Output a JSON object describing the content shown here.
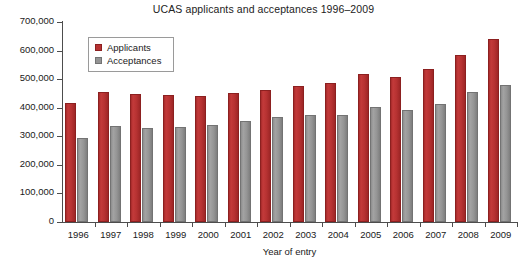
{
  "chart_data": {
    "type": "bar",
    "title": "UCAS applicants and acceptances 1996–2009",
    "xlabel": "Year of entry",
    "ylabel": "",
    "categories": [
      "1996",
      "1997",
      "1998",
      "1999",
      "2000",
      "2001",
      "2002",
      "2003",
      "2004",
      "2005",
      "2006",
      "2007",
      "2008",
      "2009"
    ],
    "series": [
      {
        "name": "Applicants",
        "color": "#b73232",
        "values": [
          415000,
          455000,
          447000,
          443000,
          441000,
          452000,
          462000,
          476000,
          488000,
          519000,
          506000,
          535000,
          583000,
          639000
        ]
      },
      {
        "name": "Acceptances",
        "color": "#949494",
        "values": [
          293000,
          336000,
          330000,
          333000,
          340000,
          353000,
          368000,
          375000,
          374000,
          404000,
          391000,
          413000,
          456000,
          478000
        ]
      }
    ],
    "ylim": [
      0,
      700000
    ],
    "ytick_step": 100000,
    "ytick_labels": [
      "0",
      "100,000",
      "200,000",
      "300,000",
      "400,000",
      "500,000",
      "600,000",
      "700,000"
    ],
    "grid": false,
    "legend_position": "top-left"
  },
  "colors": {
    "applicants": "#b73232",
    "acceptances": "#949494",
    "axis": "#4d4d4d",
    "background": "#ffffff"
  }
}
